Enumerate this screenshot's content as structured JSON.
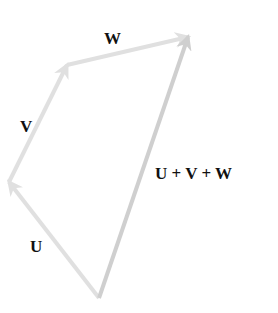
{
  "diagram": {
    "colors": {
      "background": "#ffffff",
      "component_arrow": "#e0e0e0",
      "resultant_arrow": "#cfcfcf",
      "label": "#111111"
    },
    "points": {
      "origin": {
        "x": 99,
        "y": 298
      },
      "after_u": {
        "x": 9,
        "y": 182
      },
      "after_v": {
        "x": 67,
        "y": 65
      },
      "after_w": {
        "x": 188,
        "y": 37
      }
    },
    "vectors": [
      {
        "id": "u",
        "label": "U",
        "from": "origin",
        "to": "after_u"
      },
      {
        "id": "v",
        "label": "V",
        "from": "after_u",
        "to": "after_v"
      },
      {
        "id": "w",
        "label": "W",
        "from": "after_v",
        "to": "after_w"
      },
      {
        "id": "sum",
        "label": "U + V + W",
        "from": "origin",
        "to": "after_w"
      }
    ],
    "labels": {
      "u": "U",
      "v": "V",
      "w": "W",
      "sum": "U + V + W"
    }
  }
}
